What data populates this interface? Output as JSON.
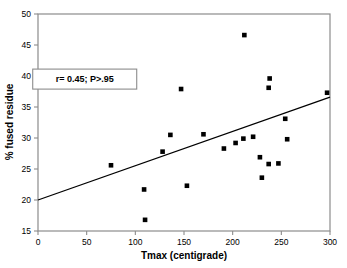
{
  "chart_data": {
    "type": "scatter",
    "title": "",
    "xlabel": "Tmax (centigrade)",
    "ylabel": "% fused residue",
    "xlim": [
      0,
      300
    ],
    "ylim": [
      15,
      50
    ],
    "xticks": [
      0,
      50,
      100,
      150,
      200,
      250,
      300
    ],
    "yticks": [
      15,
      20,
      25,
      30,
      35,
      40,
      45,
      50
    ],
    "xtick_labels": [
      "0",
      "50",
      "100",
      "150",
      "200",
      "250",
      "300"
    ],
    "ytick_labels": [
      "15",
      "20",
      "25",
      "30",
      "35",
      "40",
      "45",
      "50"
    ],
    "grid": false,
    "legend": null,
    "marker": "square",
    "marker_color": "#000000",
    "line_color": "#000000",
    "frame_color": "#888888",
    "points": [
      {
        "x": 75,
        "y": 25.6
      },
      {
        "x": 109,
        "y": 21.7
      },
      {
        "x": 110,
        "y": 16.8
      },
      {
        "x": 128,
        "y": 27.8
      },
      {
        "x": 136,
        "y": 30.5
      },
      {
        "x": 147,
        "y": 37.9
      },
      {
        "x": 153,
        "y": 22.3
      },
      {
        "x": 170,
        "y": 30.6
      },
      {
        "x": 191,
        "y": 28.3
      },
      {
        "x": 203,
        "y": 29.2
      },
      {
        "x": 211,
        "y": 29.9
      },
      {
        "x": 212,
        "y": 46.6
      },
      {
        "x": 221,
        "y": 30.2
      },
      {
        "x": 228,
        "y": 26.9
      },
      {
        "x": 230,
        "y": 23.6
      },
      {
        "x": 237,
        "y": 25.8
      },
      {
        "x": 237,
        "y": 38.1
      },
      {
        "x": 238,
        "y": 39.6
      },
      {
        "x": 247,
        "y": 25.9
      },
      {
        "x": 254,
        "y": 33.1
      },
      {
        "x": 256,
        "y": 29.8
      },
      {
        "x": 297,
        "y": 37.3
      }
    ],
    "regression_line": {
      "x_start": 0,
      "y_start": 20.0,
      "x_end": 300,
      "y_end": 36.6
    },
    "annotation": {
      "text": "r= 0.45; P>.95",
      "x": 48,
      "y": 39.5
    }
  }
}
